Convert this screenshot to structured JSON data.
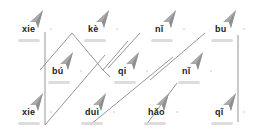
{
  "worksheet": {
    "rows": [
      {
        "items": [
          {
            "pinyin": "xie",
            "x": 22,
            "y": 30
          },
          {
            "pinyin": "kè",
            "x": 88,
            "y": 30
          },
          {
            "pinyin": "nǐ",
            "x": 155,
            "y": 30
          },
          {
            "pinyin": "bu",
            "x": 215,
            "y": 30
          }
        ]
      },
      {
        "items": [
          {
            "pinyin": "bú",
            "x": 52,
            "y": 72
          },
          {
            "pinyin": "qi",
            "x": 118,
            "y": 72
          },
          {
            "pinyin": "nǐ",
            "x": 182,
            "y": 72
          }
        ]
      },
      {
        "items": [
          {
            "pinyin": "xie",
            "x": 22,
            "y": 113
          },
          {
            "pinyin": "duì",
            "x": 85,
            "y": 113
          },
          {
            "pinyin": "hǎo",
            "x": 148,
            "y": 113
          },
          {
            "pinyin": "qǐ",
            "x": 215,
            "y": 113
          }
        ]
      }
    ],
    "line_color": "#888888",
    "icon_color": "#aaaaaa"
  }
}
